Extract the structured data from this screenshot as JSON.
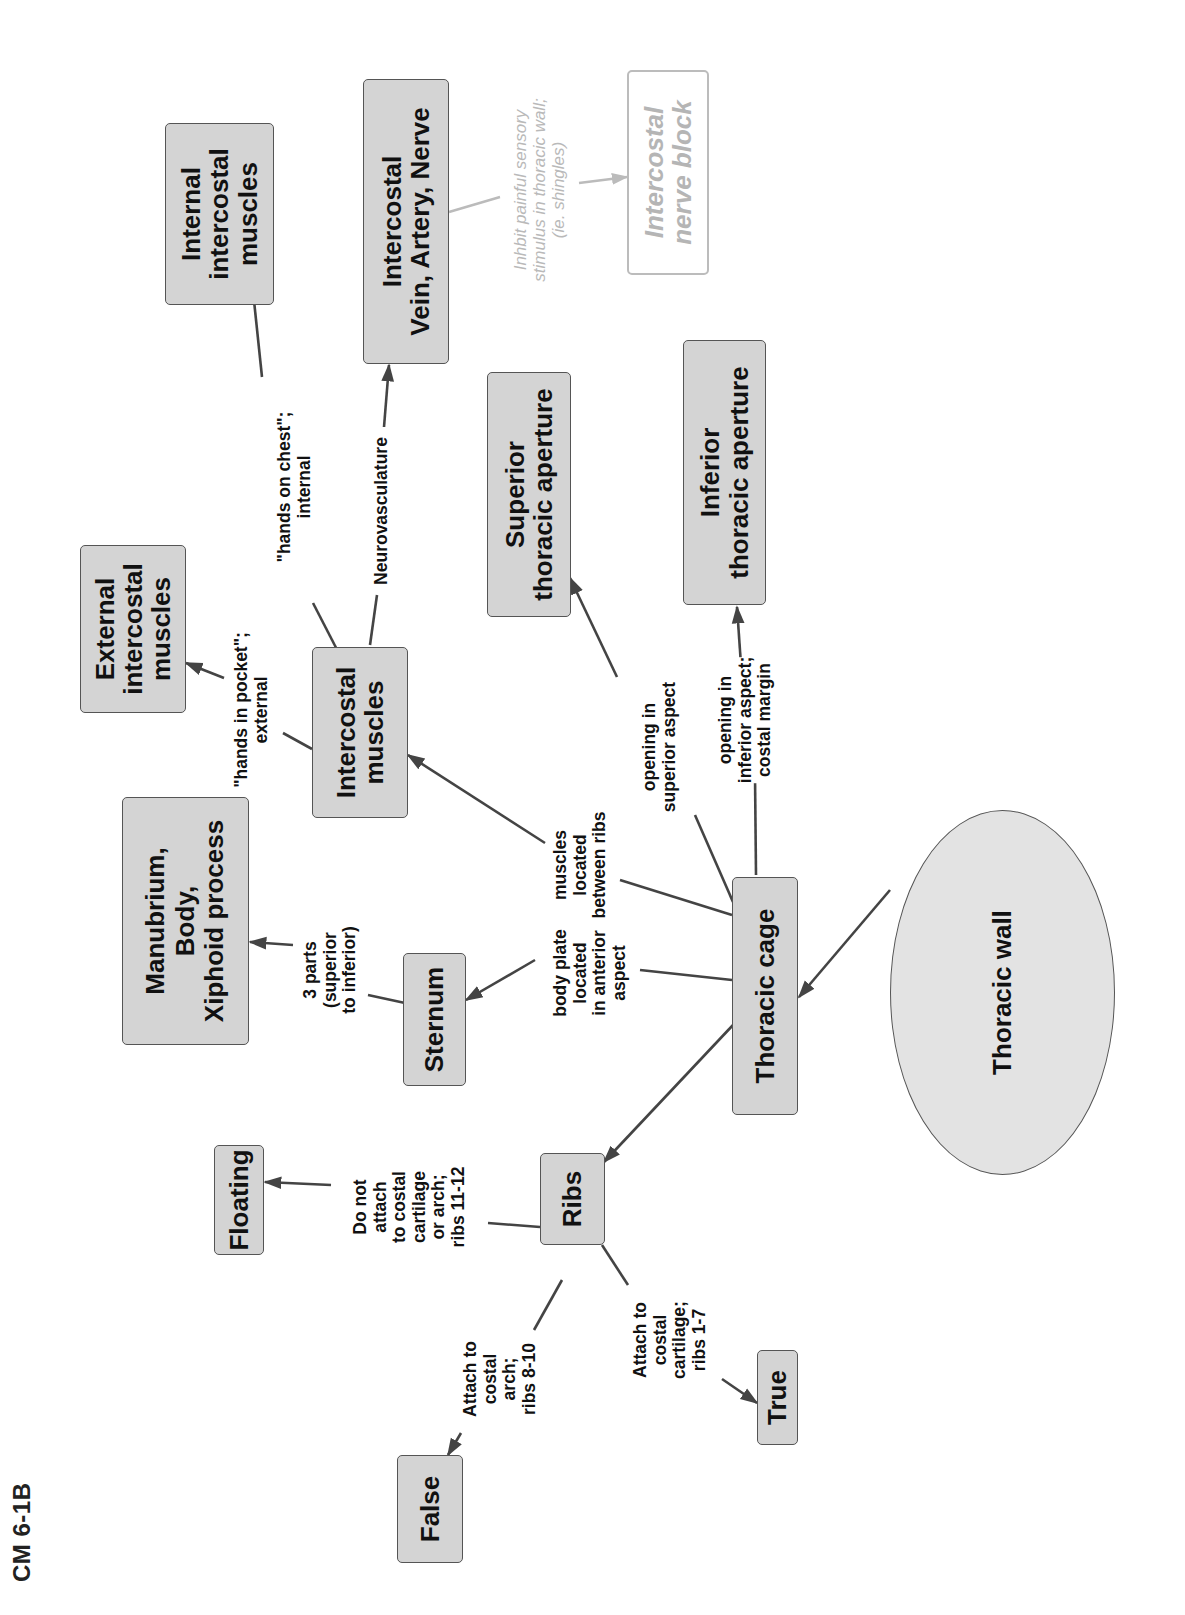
{
  "page": {
    "title": "CM 6-1B"
  },
  "diagram": {
    "type": "concept-map",
    "orientation": "rotated -90 degrees (reads bottom-to-top)",
    "colors": {
      "node_fill": "#d4d4d4",
      "root_fill": "#e3e3e3",
      "node_border": "#555555",
      "edge": "#444444",
      "faded": "#bbbbbb"
    },
    "nodes": {
      "thoracic_wall": {
        "label": "Thoracic wall"
      },
      "thoracic_cage": {
        "label": "Thoracic cage"
      },
      "sternum": {
        "label": "Sternum"
      },
      "sternum_parts": {
        "label": "Manubrium,\nBody,\nXiphoid process"
      },
      "ribs": {
        "label": "Ribs"
      },
      "floating": {
        "label": "Floating"
      },
      "false_ribs": {
        "label": "False"
      },
      "true_ribs": {
        "label": "True"
      },
      "intercostal_muscles": {
        "label": "Intercostal\nmuscles"
      },
      "external_intercostal": {
        "label": "External\nintercostal\nmuscles"
      },
      "internal_intercostal": {
        "label": "Internal\nintercostal\nmuscles"
      },
      "intercostal_van": {
        "label": "Intercostal\nVein, Artery, Nerve"
      },
      "superior_aperture": {
        "label": "Superior\nthoracic aperture"
      },
      "inferior_aperture": {
        "label": "Inferior\nthoracic aperture"
      },
      "nerve_block": {
        "label": "Intercostal\nnerve block"
      }
    },
    "edge_labels": {
      "sternum_parts": "3 parts\n(superior\nto inferior)",
      "sternum": "body plate\nlocated\nin anterior\naspect",
      "intercostal_muscles": "muscles\nlocated\nbetween ribs",
      "superior_aperture": "opening in\nsuperior aspect",
      "inferior_aperture": "opening in\ninferior aspect;\ncostal margin",
      "floating": "Do not\nattach\nto costal\ncartilage\nor arch;\nribs 11-12",
      "false_ribs": "Attach to\ncostal\narch;\nribs 8-10",
      "true_ribs": "Attach to\ncostal\ncartilage;\nribs 1-7",
      "external_intercostal": "\"hands in pocket\";\nexternal",
      "internal_intercostal": "\"hands on chest\";\ninternal",
      "intercostal_van": "Neurovasculature",
      "nerve_block": "Inhbit painful sensory\nstimulus in thoracic wall;\n(ie. shingles)"
    },
    "edges": [
      {
        "from": "Thoracic wall",
        "to": "Thoracic cage",
        "label": ""
      },
      {
        "from": "Thoracic cage",
        "to": "Ribs",
        "label": ""
      },
      {
        "from": "Thoracic cage",
        "to": "Sternum",
        "label": "body plate located in anterior aspect"
      },
      {
        "from": "Thoracic cage",
        "to": "Intercostal muscles",
        "label": "muscles located between ribs"
      },
      {
        "from": "Thoracic cage",
        "to": "Superior thoracic aperture",
        "label": "opening in superior aspect"
      },
      {
        "from": "Thoracic cage",
        "to": "Inferior thoracic aperture",
        "label": "opening in inferior aspect; costal margin"
      },
      {
        "from": "Sternum",
        "to": "Manubrium, Body, Xiphoid process",
        "label": "3 parts (superior to inferior)"
      },
      {
        "from": "Ribs",
        "to": "Floating",
        "label": "Do not attach to costal cartilage or arch; ribs 11-12"
      },
      {
        "from": "Ribs",
        "to": "False",
        "label": "Attach to costal arch; ribs 8-10"
      },
      {
        "from": "Ribs",
        "to": "True",
        "label": "Attach to costal cartilage; ribs 1-7"
      },
      {
        "from": "Intercostal muscles",
        "to": "External intercostal muscles",
        "label": "\"hands in pocket\"; external"
      },
      {
        "from": "Intercostal muscles",
        "to": "Internal intercostal muscles",
        "label": "\"hands on chest\"; internal"
      },
      {
        "from": "Intercostal muscles",
        "to": "Intercostal Vein, Artery, Nerve",
        "label": "Neurovasculature"
      },
      {
        "from": "Intercostal Vein, Artery, Nerve",
        "to": "Intercostal nerve block",
        "label": "Inhbit painful sensory stimulus in thoracic wall; (ie. shingles)"
      }
    ]
  }
}
